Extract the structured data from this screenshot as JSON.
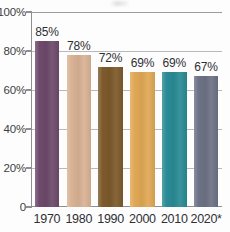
{
  "chart_data": {
    "type": "bar",
    "title": "",
    "subtitle": "",
    "xlabel": "",
    "ylabel": "",
    "categories": [
      "1970",
      "1980",
      "1990",
      "2000",
      "2010",
      "2020*"
    ],
    "values": [
      85,
      78,
      72,
      69,
      69,
      67
    ],
    "value_labels": [
      "85%",
      "78%",
      "72%",
      "69%",
      "69%",
      "67%"
    ],
    "ylim": [
      0,
      100
    ],
    "yticks": [
      0,
      20,
      40,
      60,
      80,
      100
    ],
    "ytick_labels": [
      "0",
      "20%",
      "40%",
      "60%",
      "80%",
      "100%"
    ],
    "grid": "horizontal",
    "legend": "none",
    "series": [
      {
        "name": "",
        "values": [
          85,
          78,
          72,
          69,
          69,
          67
        ]
      }
    ],
    "bar_colors": [
      "#6e4a6b",
      "#d9b294",
      "#7d5a2c",
      "#e0a855",
      "#2a8b96",
      "#6d7286"
    ],
    "annotations": [
      "* projected"
    ]
  },
  "axes": {
    "grid_color": "#b9b9bd",
    "axis_color": "#8e8e93",
    "text_color": "#2f2f34",
    "background": "#fdfdfd"
  }
}
